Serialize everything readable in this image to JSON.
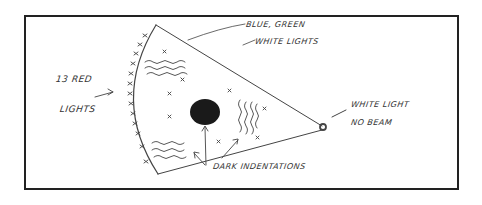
{
  "figure": {
    "type": "hand-drawn sketch"
  },
  "labels": {
    "red_lights": [
      "13 RED",
      "LIGHTS"
    ],
    "blue_green": [
      "BLUE, GREEN",
      "WHITE LIGHTS"
    ],
    "white_light": [
      "WHITE LIGHT",
      "NO BEAM"
    ],
    "dark_indentations": "DARK INDENTATIONS"
  },
  "colors": {
    "ink": "#333333",
    "frame": "#222222",
    "blob": "#1a1a1a"
  }
}
